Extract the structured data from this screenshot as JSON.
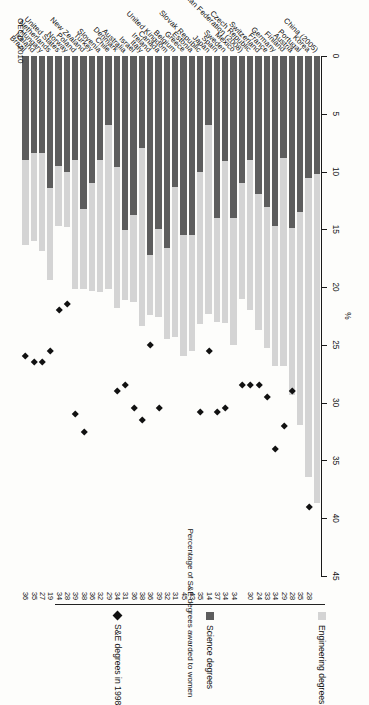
{
  "figure": {
    "axis_unit": "%",
    "source_note": "OECD, 2010",
    "value_column_caption": "Percentage of S&E degrees awarded to women"
  },
  "legend": {
    "items": [
      {
        "key": "engineering",
        "label": "Engineering degrees",
        "swatch": "square",
        "color": "#d4d4d4"
      },
      {
        "key": "science",
        "label": "Science degrees",
        "swatch": "square",
        "color": "#5d5d5d"
      },
      {
        "key": "se1998",
        "label": "S&E degrees in 1998",
        "swatch": "diamond",
        "color": "#111111"
      }
    ]
  },
  "chart_data": {
    "type": "bar",
    "orientation": "horizontal",
    "stacked": true,
    "title": "",
    "subtitle": "",
    "xlabel": "%",
    "ylabel": "",
    "xlim": [
      0,
      45
    ],
    "xticks": [
      0,
      5,
      10,
      15,
      20,
      25,
      30,
      35,
      40,
      45
    ],
    "grid": false,
    "legend_position": "right",
    "categories": [
      "China (2005)",
      "Korea",
      "Portugal",
      "Austria",
      "Finland",
      "Germany",
      "France",
      "Switzerland",
      "Czech Republic",
      "Russian Federation (2008)",
      "Mexico",
      "Sweden",
      "Spain",
      "Japan",
      "Slovak Republic",
      "Estonia",
      "Greece",
      "Belgium",
      "United Kingdom",
      "Canada",
      "Ireland",
      "Italy",
      "Israel",
      "Australia",
      "Denmark",
      "Chile",
      "Slovenia",
      "Turkey",
      "New Zealand",
      "Poland",
      "Norway",
      "United States",
      "Netherlands",
      "Hungary",
      "Iceland",
      "Brazil"
    ],
    "series": [
      {
        "name": "Science degrees",
        "color": "#5d5d5d",
        "values": [
          10.2,
          10.6,
          13.5,
          14.9,
          8.8,
          14.7,
          13.1,
          11.9,
          9.0,
          11.0,
          14.0,
          9.1,
          14.0,
          6.0,
          10.0,
          15.5,
          15.5,
          11.3,
          16.6,
          15.0,
          17.2,
          8.0,
          13.8,
          15.1,
          9.6,
          6.0,
          9.0,
          11.0,
          13.2,
          9.0,
          10.0,
          9.5,
          11.4,
          8.4,
          8.4,
          9.0
        ]
      },
      {
        "name": "Engineering degrees",
        "color": "#d4d4d4",
        "values": [
          28.5,
          25.8,
          18.4,
          14.4,
          18.0,
          12.1,
          12.2,
          11.8,
          13.0,
          10.0,
          11.0,
          14.0,
          9.0,
          16.3,
          13.2,
          10.0,
          10.5,
          13.0,
          7.9,
          7.6,
          5.2,
          15.4,
          7.5,
          6.0,
          12.2,
          14.2,
          11.4,
          9.3,
          7.0,
          11.2,
          4.8,
          5.2,
          8.0,
          8.5,
          7.6,
          7.4
        ]
      }
    ],
    "markers": {
      "name": "S&E degrees in 1998",
      "color": "#111111",
      "symbol": "diamond",
      "values": [
        null,
        39.0,
        null,
        29.0,
        32.0,
        34.0,
        29.5,
        28.5,
        28.5,
        28.5,
        null,
        30.5,
        30.8,
        25.5,
        30.8,
        null,
        null,
        null,
        null,
        30.5,
        25.0,
        31.5,
        30.5,
        28.5,
        29.0,
        null,
        null,
        null,
        32.5,
        31.0,
        21.5,
        22.0,
        25.5,
        26.5,
        26.5,
        26.0
      ]
    },
    "value_column": {
      "caption": "Percentage of S&E degrees awarded to women",
      "values": [
        null,
        28,
        35,
        28,
        29,
        34,
        33,
        24,
        30,
        null,
        34,
        34,
        37,
        14,
        35,
        43,
        45,
        31,
        32,
        39,
        36,
        38,
        36,
        31,
        34,
        29,
        32,
        36,
        38,
        39,
        28,
        34,
        19,
        27,
        35,
        36
      ]
    }
  }
}
